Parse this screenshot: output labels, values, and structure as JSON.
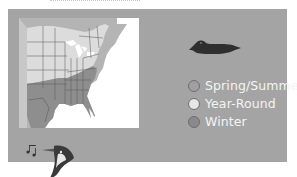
{
  "figure": {
    "panel_color": "#a4a4a4",
    "map_region": "Eastern United States range map",
    "icons": {
      "duck": "duck-silhouette-icon",
      "bird": "singing-bird-head-icon"
    }
  },
  "legend": {
    "items": [
      {
        "label": "Spring/Summer",
        "color": "#a0a0a0"
      },
      {
        "label": "Year-Round",
        "color": "#e6e6e6"
      },
      {
        "label": "Winter",
        "color": "#8a8a8a"
      }
    ]
  }
}
